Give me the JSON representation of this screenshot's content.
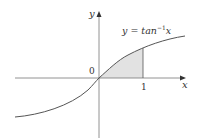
{
  "diagram": {
    "function_label": "y = tan",
    "function_exponent": "−1",
    "function_var": "x",
    "x_axis_label": "x",
    "y_axis_label": "y",
    "origin_label": "0",
    "tick_label_1": "1",
    "shaded_region": "area under y = tan⁻¹x from x = 0 to x = 1",
    "colors": {
      "curve": "#555555",
      "axis": "#777777",
      "shade": "#e2e2e2"
    }
  }
}
